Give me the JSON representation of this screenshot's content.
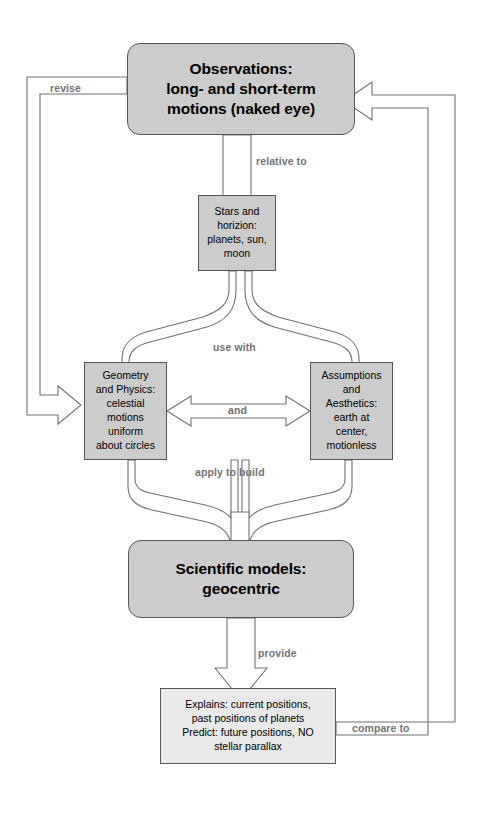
{
  "diagram": {
    "colors": {
      "node_fill": "#cccccc",
      "node_fill_light": "#e9e9e9",
      "node_stroke": "#555555",
      "arrow_stroke": "#707070",
      "label_text": "#737373",
      "node_text": "#000000",
      "background": "#ffffff"
    },
    "nodes": [
      {
        "id": "observations",
        "shape": "rounded-rect",
        "emphasis": "bold-large",
        "lines": [
          "Observations:",
          "long- and short-term",
          "motions (naked eye)"
        ]
      },
      {
        "id": "stars",
        "shape": "rect",
        "emphasis": "normal-small",
        "lines": [
          "Stars and",
          "horizion:",
          "planets, sun,",
          "moon"
        ]
      },
      {
        "id": "geometry",
        "shape": "rect",
        "emphasis": "normal-small",
        "lines": [
          "Geometry",
          "and Physics:",
          "celestial",
          "motions",
          "uniform",
          "about circles"
        ]
      },
      {
        "id": "assumptions",
        "shape": "rect",
        "emphasis": "normal-small",
        "lines": [
          "Assumptions",
          "and",
          "Aesthetics:",
          "earth at",
          "center,",
          "motionless"
        ]
      },
      {
        "id": "models",
        "shape": "rounded-rect",
        "emphasis": "bold-large",
        "lines": [
          "Scientific models:",
          "geocentric"
        ]
      },
      {
        "id": "explains",
        "shape": "rect",
        "emphasis": "normal-small",
        "lines": [
          "Explains: current positions,",
          "past positions of planets",
          "Predict: future positions, NO",
          "stellar parallax"
        ]
      }
    ],
    "edge_labels": [
      {
        "id": "revise",
        "text": "revise",
        "from": "observations",
        "to": "geometry"
      },
      {
        "id": "relative-to",
        "text": "relative to",
        "from": "observations",
        "to": "stars"
      },
      {
        "id": "use-with",
        "text": "use with",
        "from": "stars",
        "to": "geometry, assumptions"
      },
      {
        "id": "and",
        "text": "and",
        "from": "geometry",
        "to": "assumptions"
      },
      {
        "id": "apply-to-build",
        "text": "apply to build",
        "from": "geometry, assumptions",
        "to": "models"
      },
      {
        "id": "provide",
        "text": "provide",
        "from": "models",
        "to": "explains"
      },
      {
        "id": "compare-to",
        "text": "compare to",
        "from": "explains",
        "to": "observations"
      }
    ]
  }
}
